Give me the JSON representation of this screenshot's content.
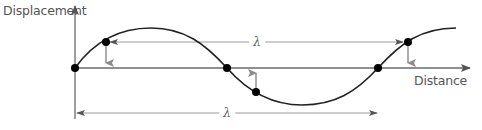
{
  "diagram": {
    "y_axis": {
      "label": "Displacement"
    },
    "x_axis": {
      "label": "Distance"
    },
    "wavelength_symbol": "λ",
    "annotations": {
      "upper_wavelength": {
        "label": "λ",
        "description": "Distance between two successive points in phase (same displacement, moving downward)"
      },
      "lower_wavelength": {
        "label": "λ",
        "description": "Distance between two successive zero-crossings in phase"
      }
    },
    "points": [
      {
        "name": "origin-zero-crossing",
        "x": 75,
        "y": 68
      },
      {
        "name": "first-rising-point",
        "x": 106,
        "y": 42
      },
      {
        "name": "middle-zero-crossing",
        "x": 227,
        "y": 68
      },
      {
        "name": "falling-point",
        "x": 256,
        "y": 92
      },
      {
        "name": "second-zero-crossing",
        "x": 378,
        "y": 68
      },
      {
        "name": "second-rising-point",
        "x": 408,
        "y": 42
      }
    ],
    "motion_arrows": [
      {
        "at": "first-rising-point",
        "direction": "down"
      },
      {
        "at": "falling-point",
        "direction": "up"
      },
      {
        "at": "second-rising-point",
        "direction": "down"
      }
    ],
    "colors": {
      "curve": "#222222",
      "axes": "#666666",
      "arrows": "#888888",
      "dots": "#000000",
      "text": "#555555"
    }
  }
}
